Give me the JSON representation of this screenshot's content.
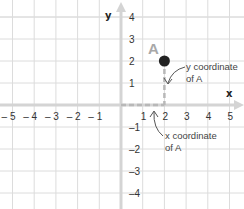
{
  "diagram": {
    "x_axis_label": "x",
    "y_axis_label": "y",
    "x_ticks": [
      {
        "value": -5,
        "label": "– 5"
      },
      {
        "value": -4,
        "label": "– 4"
      },
      {
        "value": -3,
        "label": "– 3"
      },
      {
        "value": -2,
        "label": "– 2"
      },
      {
        "value": -1,
        "label": "– 1"
      },
      {
        "value": 1,
        "label": "1"
      },
      {
        "value": 2,
        "label": "2"
      },
      {
        "value": 3,
        "label": "3"
      },
      {
        "value": 4,
        "label": "4"
      },
      {
        "value": 5,
        "label": "5"
      }
    ],
    "y_ticks": [
      {
        "value": 4,
        "label": "4"
      },
      {
        "value": 3,
        "label": "3"
      },
      {
        "value": 2,
        "label": "2"
      },
      {
        "value": 1,
        "label": "1"
      },
      {
        "value": -1,
        "label": "–1"
      },
      {
        "value": -2,
        "label": "–2"
      },
      {
        "value": -3,
        "label": "–3"
      },
      {
        "value": -4,
        "label": "–4"
      }
    ],
    "xlim": [
      -5.5,
      5.5
    ],
    "ylim": [
      -4.8,
      4.8
    ],
    "point": {
      "name": "A",
      "x": 2,
      "y": 2,
      "color": "#222222",
      "label_color": "#a8a8a8"
    },
    "annotations": {
      "y_coord": {
        "line1": "y coordinate",
        "line2": "of A"
      },
      "x_coord": {
        "line1": "x coordinate",
        "line2": "of A"
      }
    },
    "colors": {
      "grid": "#dcdcdc",
      "axis": "#d4d4d4",
      "guide": "#b8b8b8"
    }
  }
}
